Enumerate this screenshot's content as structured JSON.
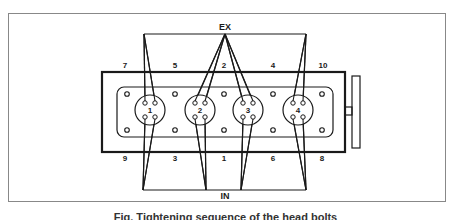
{
  "figure": {
    "labels": {
      "exhaust": "EX",
      "intake": "IN"
    },
    "bolt_sequence_top": [
      {
        "label": "7",
        "x": 117
      },
      {
        "label": "5",
        "x": 175
      },
      {
        "label": "2",
        "x": 224
      },
      {
        "label": "4",
        "x": 273
      },
      {
        "label": "10",
        "x": 322
      }
    ],
    "bolt_sequence_bottom": [
      {
        "label": "9",
        "x": 125
      },
      {
        "label": "3",
        "x": 175
      },
      {
        "label": "1",
        "x": 224
      },
      {
        "label": "6",
        "x": 273
      },
      {
        "label": "8",
        "x": 322
      }
    ],
    "cylinders": [
      {
        "label": "1",
        "cx": 150
      },
      {
        "label": "2",
        "cx": 200
      },
      {
        "label": "3",
        "cx": 248
      },
      {
        "label": "4",
        "cx": 298
      }
    ],
    "caption": "Fig. Tightening sequence of the head bolts"
  },
  "colors": {
    "line": "#1a1a1a",
    "frame": "#888888",
    "background": "#ffffff"
  }
}
